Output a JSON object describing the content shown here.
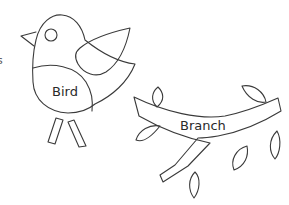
{
  "labels": {
    "bird": "Bird",
    "branch": "Branch",
    "edge_fragment": "s"
  },
  "colors": {
    "stroke": "#3a3a3a",
    "background": "#ffffff"
  }
}
